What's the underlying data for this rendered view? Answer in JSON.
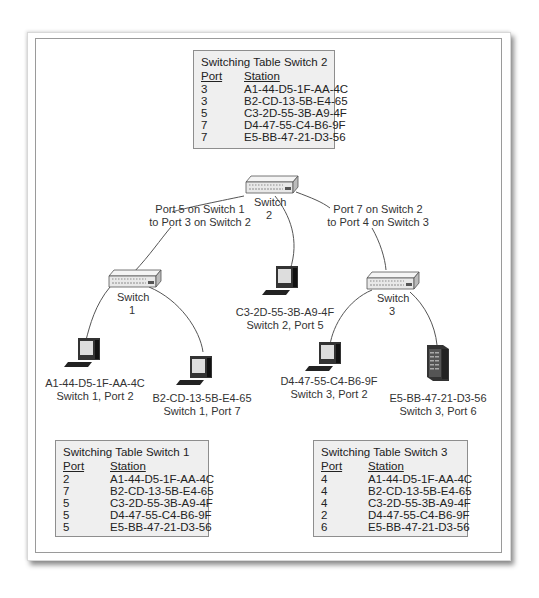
{
  "switches": [
    {
      "id": "switch-2",
      "label_line1": "Switch",
      "label_line2": "2"
    },
    {
      "id": "switch-1",
      "label_line1": "Switch",
      "label_line2": "1"
    },
    {
      "id": "switch-3",
      "label_line1": "Switch",
      "label_line2": "3"
    }
  ],
  "links": {
    "s1_s2": {
      "line1": "Port 5 on Switch 1",
      "line2": "to Port 3 on Switch 2"
    },
    "s2_s3": {
      "line1": "Port 7 on Switch 2",
      "line2": "to Port 4 on Switch 3"
    }
  },
  "stations": [
    {
      "mac": "A1-44-D5-1F-AA-4C",
      "location": "Switch 1, Port 2",
      "type": "workstation"
    },
    {
      "mac": "B2-CD-13-5B-E4-65",
      "location": "Switch 1, Port 7",
      "type": "workstation"
    },
    {
      "mac": "C3-2D-55-3B-A9-4F",
      "location": "Switch 2, Port 5",
      "type": "workstation"
    },
    {
      "mac": "D4-47-55-C4-B6-9F",
      "location": "Switch 3, Port 2",
      "type": "workstation"
    },
    {
      "mac": "E5-BB-47-21-D3-56",
      "location": "Switch 3, Port 6",
      "type": "server"
    }
  ],
  "tables": {
    "switch2": {
      "title": "Switching Table Switch 2",
      "headers": {
        "port": "Port",
        "station": "Station"
      },
      "rows": [
        {
          "port": "3",
          "station": "A1-44-D5-1F-AA-4C"
        },
        {
          "port": "3",
          "station": "B2-CD-13-5B-E4-65"
        },
        {
          "port": "5",
          "station": "C3-2D-55-3B-A9-4F"
        },
        {
          "port": "7",
          "station": "D4-47-55-C4-B6-9F"
        },
        {
          "port": "7",
          "station": "E5-BB-47-21-D3-56"
        }
      ]
    },
    "switch1": {
      "title": "Switching Table Switch 1",
      "headers": {
        "port": "Port",
        "station": "Station"
      },
      "rows": [
        {
          "port": "2",
          "station": "A1-44-D5-1F-AA-4C"
        },
        {
          "port": "7",
          "station": "B2-CD-13-5B-E4-65"
        },
        {
          "port": "5",
          "station": "C3-2D-55-3B-A9-4F"
        },
        {
          "port": "5",
          "station": "D4-47-55-C4-B6-9F"
        },
        {
          "port": "5",
          "station": "E5-BB-47-21-D3-56"
        }
      ]
    },
    "switch3": {
      "title": "Switching Table Switch 3",
      "headers": {
        "port": "Port",
        "station": "Station"
      },
      "rows": [
        {
          "port": "4",
          "station": "A1-44-D5-1F-AA-4C"
        },
        {
          "port": "4",
          "station": "B2-CD-13-5B-E4-65"
        },
        {
          "port": "4",
          "station": "C3-2D-55-3B-A9-4F"
        },
        {
          "port": "2",
          "station": "D4-47-55-C4-B6-9F"
        },
        {
          "port": "6",
          "station": "E5-BB-47-21-D3-56"
        }
      ]
    }
  },
  "colors": {
    "table_bg": "#efefef",
    "table_border": "#8e8e8e",
    "line": "#555555",
    "frame_border": "#9a9a9a"
  }
}
